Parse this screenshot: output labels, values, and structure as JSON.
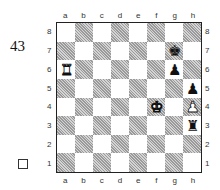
{
  "diagram": {
    "number": "43",
    "to_move_indicator": "white-square",
    "files": [
      "a",
      "b",
      "c",
      "d",
      "e",
      "f",
      "g",
      "h"
    ],
    "ranks": [
      "8",
      "7",
      "6",
      "5",
      "4",
      "3",
      "2",
      "1"
    ],
    "pieces": [
      {
        "square": "g7",
        "piece": "king",
        "color": "black",
        "glyph": "♚"
      },
      {
        "square": "a6",
        "piece": "rook",
        "color": "white",
        "glyph": "♜"
      },
      {
        "square": "g6",
        "piece": "pawn",
        "color": "black",
        "glyph": "♟"
      },
      {
        "square": "h5",
        "piece": "pawn",
        "color": "black",
        "glyph": "♟"
      },
      {
        "square": "f4",
        "piece": "king",
        "color": "white",
        "glyph": "♚"
      },
      {
        "square": "h4",
        "piece": "pawn",
        "color": "white",
        "glyph": "♟"
      },
      {
        "square": "h3",
        "piece": "rook",
        "color": "black",
        "glyph": "♜"
      }
    ]
  }
}
